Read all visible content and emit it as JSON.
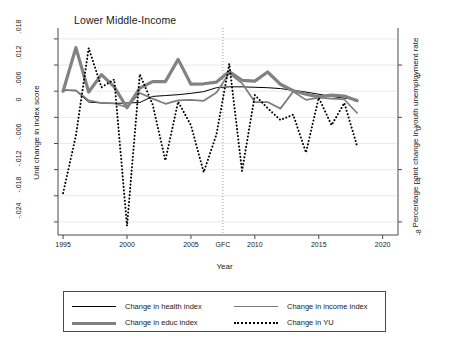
{
  "chart_data": {
    "type": "line",
    "title": "Lower Middle-Income",
    "xlabel": "Year",
    "ylabel": "Unit change in index score",
    "ylabel_right": "Percentage point change in youth unemployment rate",
    "grid": true,
    "legend_position": "bottom",
    "xlim": [
      1994.6,
      2021.2
    ],
    "ylim": [
      -0.027,
      0.0205
    ],
    "ylim_right": [
      -9.0,
      6.833
    ],
    "xticks": [
      1995,
      2000,
      2005,
      2007.5,
      2010,
      2015,
      2020
    ],
    "xticklabels": [
      "1995",
      "2000",
      "2005",
      "GFC",
      "2010",
      "2015",
      "2020"
    ],
    "yticks": [
      0.018,
      0.012,
      0.006,
      0,
      -0.006,
      -0.012,
      -0.018,
      -0.024
    ],
    "yticklabels": [
      ".018",
      ".012",
      ".006",
      "0",
      "-.006",
      "-.012",
      "-.018",
      "-.024"
    ],
    "yticks_right": [
      4,
      0,
      -4,
      -8
    ],
    "yticklabels_right": [
      "4",
      "0",
      "-4",
      "-8"
    ],
    "annotations": [
      {
        "type": "vline",
        "x": 2007.5,
        "label": "GFC",
        "style": "dotted"
      }
    ],
    "x": [
      1995,
      1996,
      1997,
      1998,
      1999,
      2000,
      2001,
      2002,
      2003,
      2004,
      2005,
      2006,
      2007,
      2008,
      2009,
      2010,
      2011,
      2012,
      2013,
      2014,
      2015,
      2016,
      2017,
      2018
    ],
    "series": [
      {
        "name": "Change in health index",
        "axis": "left",
        "color": "#000000",
        "width": 1,
        "style": "solid",
        "values": [
          0.0062,
          0.0061,
          0.0035,
          0.0033,
          0.0032,
          0.0033,
          0.0034,
          0.0048,
          0.005,
          0.0052,
          0.0055,
          0.0059,
          0.0068,
          0.007,
          0.007,
          0.0069,
          0.0068,
          0.0066,
          0.0062,
          0.0058,
          0.0053,
          0.0048,
          0.0044,
          0.0041
        ]
      },
      {
        "name": "Change in income index",
        "axis": "left",
        "color": "#7d7d7d",
        "width": 1.7,
        "style": "solid",
        "values": [
          0.0063,
          0.0062,
          0.0039,
          0.0033,
          0.0032,
          0.0023,
          0.0056,
          0.0043,
          0.0031,
          0.0039,
          0.004,
          0.0038,
          0.0057,
          0.0101,
          0.0078,
          0.0035,
          0.0035,
          0.002,
          0.0059,
          0.004,
          0.0045,
          0.0043,
          0.0041,
          0.001
        ]
      },
      {
        "name": "Change in educ index",
        "axis": "left",
        "color": "#828282",
        "width": 3.2,
        "style": "solid",
        "values": [
          0.006,
          0.016,
          0.0058,
          0.0098,
          0.007,
          0.0022,
          0.0067,
          0.0082,
          0.0082,
          0.0133,
          0.0076,
          0.0077,
          0.0081,
          0.0105,
          0.0085,
          0.0083,
          0.0104,
          0.0076,
          0.0061,
          0.0053,
          0.0047,
          0.0051,
          0.0049,
          0.0038
        ]
      },
      {
        "name": "Change in YU",
        "axis": "right",
        "color": "#000000",
        "width": 2.0,
        "style": "dotted",
        "values_right": [
          -5.8,
          -1.4,
          5.3,
          2.3,
          2.9,
          -8.3,
          3.3,
          1.0,
          -3.3,
          1.2,
          -0.6,
          -4.2,
          -1.3,
          4.1,
          -4.1,
          1.7,
          0.7,
          -0.2,
          0.2,
          -2.7,
          1.5,
          -0.6,
          1.1,
          -2.2
        ]
      }
    ]
  },
  "legend": {
    "items": [
      {
        "label": "Change in health index",
        "key": "health"
      },
      {
        "label": "Change in income index",
        "key": "income"
      },
      {
        "label": "Change in educ index",
        "key": "educ"
      },
      {
        "label": "Change in YU",
        "key": "yu"
      }
    ]
  },
  "colors": {
    "axis": "#4a4a4a",
    "grid": "#e6e6e6",
    "health": "#000000",
    "income": "#7d7d7d",
    "educ": "#828282",
    "yu": "#000000",
    "background": "#ffffff"
  }
}
